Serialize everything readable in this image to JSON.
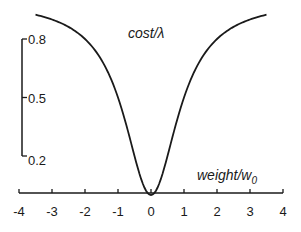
{
  "chart_data": {
    "type": "line",
    "title": "",
    "xlabel": "weight/w0",
    "xlabel_main": "weight/w",
    "xlabel_sub": "0",
    "ylabel": "cost/λ",
    "xlim": [
      -4,
      4
    ],
    "ylim": [
      0,
      1
    ],
    "x_ticks": [
      -4,
      -3,
      -2,
      -1,
      0,
      1,
      2,
      3,
      4
    ],
    "x_tick_labels": [
      "-4",
      "-3",
      "-2",
      "-1",
      "0",
      "1",
      "2",
      "3",
      "4"
    ],
    "y_ticks": [
      0.2,
      0.5,
      0.8
    ],
    "y_tick_labels": [
      "0.2",
      "0.5",
      "0.8"
    ],
    "grid": false,
    "legend": null,
    "series": [
      {
        "name": "cost/λ",
        "formula": "w^2 / (1 + w^2)",
        "x": [
          -3.5,
          -3.0,
          -2.5,
          -2.0,
          -1.5,
          -1.0,
          -0.75,
          -0.5,
          -0.25,
          0.0,
          0.25,
          0.5,
          0.75,
          1.0,
          1.5,
          2.0,
          2.5,
          3.0,
          3.5
        ],
        "values": [
          0.925,
          0.9,
          0.862,
          0.8,
          0.692,
          0.5,
          0.36,
          0.2,
          0.059,
          0.0,
          0.059,
          0.2,
          0.36,
          0.5,
          0.692,
          0.8,
          0.862,
          0.9,
          0.925
        ]
      }
    ],
    "colors": {
      "line": "#1a1a1a",
      "background": "#ffffff"
    }
  }
}
